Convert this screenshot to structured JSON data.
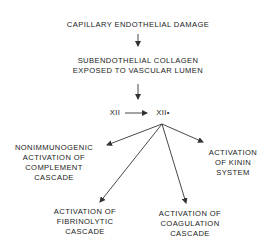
{
  "diagram": {
    "nodes": {
      "damage": {
        "lines": [
          "CAPILLARY ENDOTHELIAL DAMAGE"
        ]
      },
      "collagen": {
        "lines": [
          "SUBENDOTHELIAL COLLAGEN",
          "EXPOSED TO VASCULAR LUMEN"
        ]
      },
      "xii": {
        "lines": [
          "XII"
        ]
      },
      "xii_active": {
        "lines": [
          "XII•"
        ]
      },
      "complement": {
        "lines": [
          "NONIMMUNOGENIC",
          "ACTIVATION OF",
          "COMPLEMENT",
          "CASCADE"
        ]
      },
      "kinin": {
        "lines": [
          "ACTIVATION",
          "OF KININ",
          "SYSTEM"
        ]
      },
      "fibrinolytic": {
        "lines": [
          "ACTIVATION OF",
          "FIBRINOLYTIC",
          "CASCADE"
        ]
      },
      "coagulation": {
        "lines": [
          "ACTIVATION OF",
          "COAGULATION",
          "CASCADE"
        ]
      }
    },
    "edges": [
      {
        "from": "damage",
        "to": "collagen"
      },
      {
        "from": "collagen",
        "to": "xii"
      },
      {
        "from": "xii",
        "to": "xii_active"
      },
      {
        "from": "xii_active",
        "to": "complement"
      },
      {
        "from": "xii_active",
        "to": "fibrinolytic"
      },
      {
        "from": "xii_active",
        "to": "coagulation"
      },
      {
        "from": "xii_active",
        "to": "kinin"
      }
    ],
    "line_color": "#333333"
  }
}
